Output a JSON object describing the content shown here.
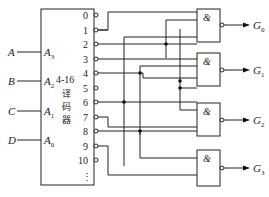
{
  "decoder": {
    "name_line1": "4-16",
    "name_line2": "译",
    "name_line3": "码",
    "name_line4": "器",
    "inputs": [
      {
        "signal": "A",
        "pin": "A",
        "sub": "3"
      },
      {
        "signal": "B",
        "pin": "A",
        "sub": "2"
      },
      {
        "signal": "C",
        "pin": "A",
        "sub": "1"
      },
      {
        "signal": "D",
        "pin": "A",
        "sub": "0"
      }
    ],
    "outputs": [
      "0",
      "1",
      "2",
      "3",
      "4",
      "5",
      "6",
      "7",
      "8",
      "9",
      "10"
    ],
    "ellipsis": "⋮"
  },
  "gates": [
    {
      "symbol": "&",
      "output": "G",
      "sub": "0",
      "inputs": [
        "0",
        "1",
        "2",
        "3"
      ]
    },
    {
      "symbol": "&",
      "output": "G",
      "sub": "1",
      "inputs": [
        "1",
        "3",
        "4",
        "6"
      ]
    },
    {
      "symbol": "&",
      "output": "G",
      "sub": "2",
      "inputs": [
        "2",
        "3",
        "4",
        "6",
        "8"
      ]
    },
    {
      "symbol": "&",
      "output": "G",
      "sub": "3",
      "inputs": [
        "8",
        "9"
      ]
    }
  ]
}
